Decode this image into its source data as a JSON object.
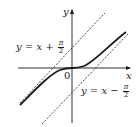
{
  "diagram": {
    "title": "",
    "axes": {
      "x_label": "x",
      "y_label": "y",
      "origin_label": "0"
    },
    "asymptotes": [
      {
        "name": "upper",
        "equation_lhs": "y = x + ",
        "frac_num": "π",
        "frac_den": "2",
        "style": "dashed"
      },
      {
        "name": "lower",
        "equation_lhs": "y = x − ",
        "frac_num": "π",
        "frac_den": "2",
        "style": "dashed"
      }
    ],
    "curve": {
      "description": "solid curve through origin approaching both asymptotes",
      "style": "solid"
    },
    "colors": {
      "ink": "#1a1a1a",
      "background": "#ffffff"
    }
  }
}
